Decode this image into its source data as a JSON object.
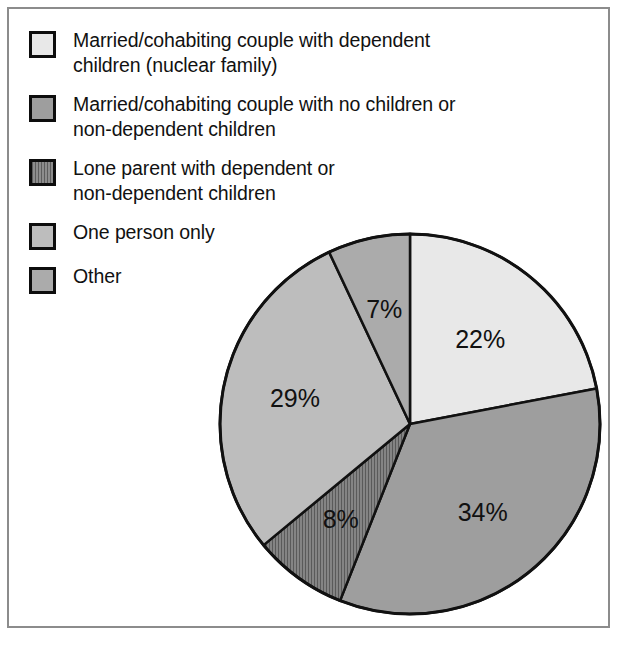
{
  "legend": {
    "items": [
      {
        "label": "Married/cohabiting couple with dependent\nchildren (nuclear family)",
        "swatch": "nuclear-swatch",
        "fill": "#e8e8e8",
        "pattern": "solid"
      },
      {
        "label": "Married/cohabiting couple with no children or\nnon-dependent children",
        "swatch": "no-children-swatch",
        "fill": "#9e9e9e",
        "pattern": "solid"
      },
      {
        "label": "Lone parent with dependent or\nnon-dependent children",
        "swatch": "lone-parent-swatch",
        "fill": "#7e7e7e",
        "pattern": "vertical-hatch"
      },
      {
        "label": "One person only",
        "swatch": "one-person-swatch",
        "fill": "#bdbdbd",
        "pattern": "solid"
      },
      {
        "label": "Other",
        "swatch": "other-swatch",
        "fill": "#ababab",
        "pattern": "solid"
      }
    ]
  },
  "labels": {
    "nuclear": "22%",
    "no_children": "34%",
    "lone_parent": "8%",
    "one_person": "29%",
    "other": "7%"
  },
  "chart_data": {
    "type": "pie",
    "title": "",
    "categories": [
      "Married/cohabiting couple with dependent children (nuclear family)",
      "Married/cohabiting couple with no children or non-dependent children",
      "Lone parent with dependent or non-dependent children",
      "One person only",
      "Other"
    ],
    "values": [
      22,
      34,
      8,
      29,
      7
    ],
    "value_labels": [
      "22%",
      "34%",
      "8%",
      "29%",
      "7%"
    ],
    "units": "percent",
    "total": 100,
    "start_angle_deg": 0,
    "direction": "clockwise",
    "slice_fills": [
      "#e8e8e8",
      "#9e9e9e",
      "#7e7e7e",
      "#bdbdbd",
      "#ababab"
    ],
    "slice_patterns": [
      "solid",
      "solid",
      "vertical-hatch",
      "solid",
      "solid"
    ],
    "legend_position": "top-left",
    "grid": false,
    "xlabel": "",
    "ylabel": ""
  }
}
